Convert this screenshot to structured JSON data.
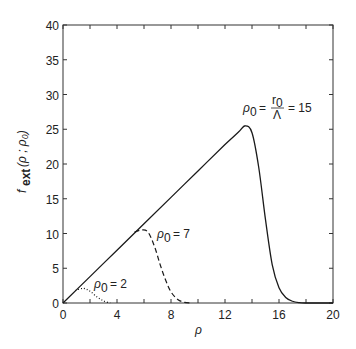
{
  "chart_data": {
    "type": "line",
    "title": "",
    "xlabel": "ρ",
    "ylabel": "f_ext (ρ ; ρ₀)",
    "xlim": [
      0,
      20
    ],
    "ylim": [
      0,
      40
    ],
    "xticks": [
      0,
      4,
      8,
      12,
      16,
      20
    ],
    "yticks": [
      0,
      5,
      10,
      15,
      20,
      25,
      30,
      35,
      40
    ],
    "minor_xticks": [
      2,
      6,
      10,
      14,
      18
    ],
    "grid": false,
    "legend": "none (curves annotated inline)",
    "series": [
      {
        "name": "ρ₀ = r₀/Λ = 15",
        "style": "solid",
        "x": [
          0,
          2,
          4,
          6,
          8,
          10,
          12,
          13,
          13.5,
          14,
          14.5,
          15,
          15.5,
          16,
          16.5,
          17,
          17.5,
          18,
          19,
          20
        ],
        "y": [
          0,
          3.8,
          7.6,
          11.4,
          15.2,
          19,
          22.8,
          24.6,
          25.5,
          24.5,
          19.5,
          12,
          5.5,
          2.2,
          0.8,
          0.25,
          0.05,
          0,
          0,
          0
        ]
      },
      {
        "name": "ρ₀ = 7",
        "style": "dashed",
        "x": [
          5.3,
          5.8,
          6.3,
          6.8,
          7.2,
          7.6,
          8,
          8.5,
          9,
          9.5
        ],
        "y": [
          10.2,
          10.5,
          10.2,
          8,
          5.5,
          3.3,
          1.6,
          0.5,
          0.1,
          0
        ]
      },
      {
        "name": "ρ₀ = 2",
        "style": "dotted",
        "x": [
          0.9,
          1.5,
          2,
          2.5,
          3,
          3.5
        ],
        "y": [
          1.8,
          2.1,
          1.7,
          0.9,
          0.3,
          0
        ]
      }
    ],
    "annotations": [
      {
        "text": "ρ₀ = r₀/Λ = 15",
        "x": 13.5,
        "y": 29
      },
      {
        "text": "ρ₀ = 7",
        "x": 7.2,
        "y": 10.5
      },
      {
        "text": "ρ₀ = 2",
        "x": 2.5,
        "y": 2.5
      }
    ]
  },
  "labels": {
    "xlabel": "ρ",
    "ylabel_main": "f",
    "ylabel_sub": "ext",
    "ylabel_args": "(ρ ; ρ₀)",
    "ann15_rho": "ρ",
    "ann15_sub": "0",
    "ann15_eq1": "=",
    "ann15_num": "r",
    "ann15_numsub": "0",
    "ann15_den": "Λ",
    "ann15_eq2": "= 15",
    "ann7_rho": "ρ",
    "ann7_sub": "0",
    "ann7_rest": "= 7",
    "ann2_rho": "ρ",
    "ann2_sub": "0",
    "ann2_rest": "= 2"
  }
}
